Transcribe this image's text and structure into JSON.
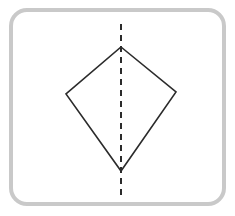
{
  "figure": {
    "name": "kite-with-line-of-symmetry",
    "canvas": {
      "width": 235,
      "height": 216,
      "background_color": "#ffffff"
    },
    "frame": {
      "name": "rounded-frame",
      "x": 11,
      "y": 10,
      "width": 213,
      "height": 194,
      "corner_radius": 16,
      "stroke_color": "#c9c9c9",
      "stroke_width": 4,
      "fill_color": "#ffffff"
    },
    "shape": {
      "name": "kite-polygon",
      "type": "kite",
      "stroke_color": "#2b2b2b",
      "stroke_width": 1.6,
      "fill_color": "none",
      "vertices": [
        {
          "label": "apex",
          "x": 121,
          "y": 47
        },
        {
          "label": "right",
          "x": 176,
          "y": 92
        },
        {
          "label": "bottom",
          "x": 121,
          "y": 171
        },
        {
          "label": "left",
          "x": 66,
          "y": 94
        }
      ]
    },
    "symmetry_line": {
      "name": "vertical-dashed-symmetry-axis",
      "orientation": "vertical",
      "x": 121,
      "y_start": 24,
      "y_end": 196,
      "stroke_color": "#2b2b2b",
      "stroke_width": 2,
      "dash_length": 6,
      "gap_length": 5
    }
  }
}
